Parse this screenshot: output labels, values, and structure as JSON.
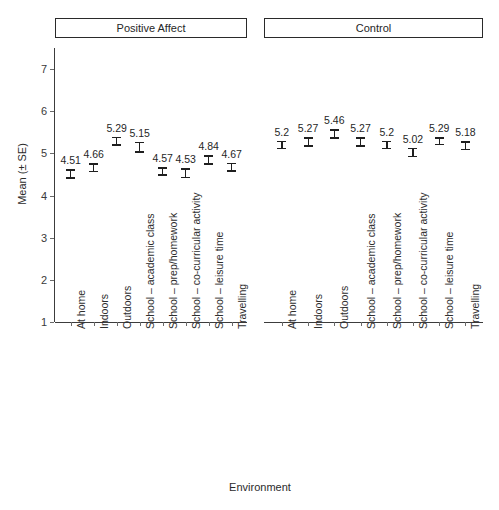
{
  "chart_data": {
    "type": "scatter",
    "title": "",
    "xlabel": "Environment",
    "ylabel": "Mean (± SE)",
    "ylim": [
      1,
      7.5
    ],
    "yticks": [
      1,
      2,
      3,
      4,
      5,
      6,
      7
    ],
    "ytick_labels": [
      "1",
      "2",
      "3",
      "4",
      "5",
      "6",
      "7"
    ],
    "grid": false,
    "legend": "none",
    "error_bars": "standard error",
    "categories": [
      "At home",
      "Indoors",
      "Outdoors",
      "School – academic class",
      "School – prep/homework",
      "School – co-curricular activity",
      "School – leisure time",
      "Travelling"
    ],
    "panels": [
      {
        "label": "Positive Affect",
        "values": [
          4.51,
          4.66,
          5.29,
          5.15,
          4.57,
          4.53,
          4.84,
          4.67
        ],
        "value_labels": [
          "4.51",
          "4.66",
          "5.29",
          "5.15",
          "4.57",
          "4.53",
          "4.84",
          "4.67"
        ],
        "errors": [
          0.11,
          0.11,
          0.11,
          0.13,
          0.1,
          0.12,
          0.11,
          0.11
        ]
      },
      {
        "label": "Control",
        "values": [
          5.2,
          5.27,
          5.46,
          5.27,
          5.2,
          5.02,
          5.29,
          5.18
        ],
        "value_labels": [
          "5.2",
          "5.27",
          "5.46",
          "5.27",
          "5.2",
          "5.02",
          "5.29",
          "5.18"
        ],
        "errors": [
          0.1,
          0.11,
          0.11,
          0.12,
          0.1,
          0.11,
          0.1,
          0.11
        ]
      }
    ]
  },
  "axes": {
    "y_title": "Mean (± SE)",
    "x_title": "Environment"
  }
}
